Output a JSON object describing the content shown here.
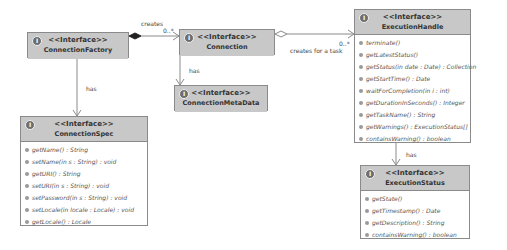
{
  "diagram": {
    "stereotype": "<<Interface>>",
    "icon_glyph": "I",
    "classes": {
      "connection_factory": {
        "name": "ConnectionFactory",
        "operations": []
      },
      "connection": {
        "name": "Connection",
        "operations": []
      },
      "connection_meta_data": {
        "name": "ConnectionMetaData",
        "operations": []
      },
      "connection_spec": {
        "name": "ConnectionSpec",
        "operations": [
          "getName() : String",
          "setName(in s : String) : void",
          "getURI() : String",
          "setURI(in s : String) : void",
          "setPassword(in s : String) : void",
          "setLocale(in locale : Locale) : void",
          "getLocale() : Locale"
        ]
      },
      "execution_handle": {
        "name": "ExecutionHandle",
        "operations": [
          "terminate()",
          "getLatestStatus()",
          "getStatus(in date : Date) : Collection",
          "getStartTime() : Date",
          "waitForCompletion(in i : int)",
          "getDurationInSeconds() : Integer",
          "getTaskName() : String",
          "getWarnings() : ExecutionStatus[]",
          "containsWarning() : boolean"
        ]
      },
      "execution_status": {
        "name": "ExecutionStatus",
        "operations": [
          "getState()",
          "getTimestamp() : Date",
          "getDescription() : String",
          "containsWarning() : boolean"
        ]
      }
    },
    "relations": {
      "factory_connection": {
        "label": "creates",
        "multiplicity": "0..*"
      },
      "connection_handle": {
        "label": "creates for a task",
        "multiplicity": "0..*"
      },
      "factory_spec": {
        "label": "has"
      },
      "connection_meta": {
        "label": "has"
      },
      "handle_status": {
        "label": "has"
      }
    },
    "colors": {
      "header": "#c8c8c8",
      "border": "#8a8a8a",
      "line": "#8a8a8a"
    }
  }
}
